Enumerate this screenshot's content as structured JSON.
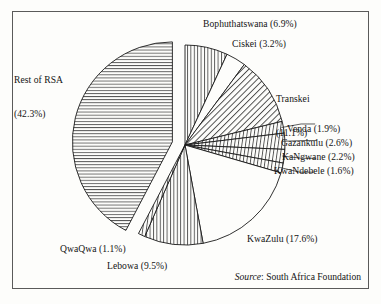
{
  "figure": {
    "background_color": "#fdfdfb",
    "frame_color": "#5a5a5a",
    "slice_line_color": "#1a1a1a"
  },
  "source": {
    "prefix": "Source",
    "separator": ": ",
    "text": "South Africa Foundation"
  },
  "chart_data": {
    "type": "pie",
    "title": "",
    "subtitle": "",
    "xlabel": "",
    "ylabel": "",
    "legend_position": "none",
    "grid": false,
    "units": "percent",
    "total": 100.0,
    "start_angle_deg": 0,
    "direction": "clockwise",
    "center": {
      "x": 185,
      "y": 145
    },
    "radius": 100,
    "categories": [
      "Bophuthatswana",
      "Ciskei",
      "Transkei",
      "Venda",
      "Gazankulu",
      "KaNgwane",
      "KwaNdebele",
      "KwaZulu",
      "Lebowa",
      "QwaQwa",
      "Rest of RSA"
    ],
    "values": [
      6.9,
      3.2,
      11.1,
      1.9,
      2.6,
      2.2,
      1.6,
      17.6,
      9.5,
      1.1,
      42.3
    ],
    "slices": [
      {
        "name": "Bophuthatswana",
        "value": 6.9,
        "label": "Bophuthatswana (6.9%)",
        "label_lines": [
          "Bophuthatswana (6.9%)"
        ],
        "fill": "vertical-hatch",
        "exploded": false,
        "leader": false
      },
      {
        "name": "Ciskei",
        "value": 3.2,
        "label": "Ciskei (3.2%)",
        "label_lines": [
          "Ciskei (3.2%)"
        ],
        "fill": "none",
        "exploded": false,
        "leader": false
      },
      {
        "name": "Transkei",
        "value": 11.1,
        "label": "Transkei (11.1%)",
        "label_lines": [
          "Transkei",
          "(11.1%)"
        ],
        "fill": "diagonal-hatch",
        "exploded": false,
        "leader": false
      },
      {
        "name": "Venda",
        "value": 1.9,
        "label": "Venda (1.9%)",
        "label_lines": [
          "Venda (1.9%)"
        ],
        "fill": "thin-wedge",
        "exploded": false,
        "leader": true
      },
      {
        "name": "Gazankulu",
        "value": 2.6,
        "label": "Gazankulu (2.6%)",
        "label_lines": [
          "Gazankulu (2.6%)"
        ],
        "fill": "thin-wedge",
        "exploded": false,
        "leader": true
      },
      {
        "name": "KaNgwane",
        "value": 2.2,
        "label": "KaNgwane (2.2%)",
        "label_lines": [
          "KaNgwane (2.2%)"
        ],
        "fill": "thin-wedge",
        "exploded": false,
        "leader": true
      },
      {
        "name": "KwaNdebele",
        "value": 1.6,
        "label": "KwaNdebele (1.6%)",
        "label_lines": [
          "KwaNdebele (1.6%)"
        ],
        "fill": "thin-wedge",
        "exploded": false,
        "leader": true
      },
      {
        "name": "KwaZulu",
        "value": 17.6,
        "label": "KwaZulu (17.6%)",
        "label_lines": [
          "KwaZulu (17.6%)"
        ],
        "fill": "none",
        "exploded": false,
        "leader": false
      },
      {
        "name": "Lebowa",
        "value": 9.5,
        "label": "Lebowa (9.5%)",
        "label_lines": [
          "Lebowa (9.5%)"
        ],
        "fill": "vertical-hatch",
        "exploded": false,
        "leader": false
      },
      {
        "name": "QwaQwa",
        "value": 1.1,
        "label": "QwaQwa (1.1%)",
        "label_lines": [
          "QwaQwa (1.1%)"
        ],
        "fill": "thin-wedge",
        "exploded": false,
        "leader": false
      },
      {
        "name": "Rest of RSA",
        "value": 42.3,
        "label": "Rest of RSA (42.3%)",
        "label_lines": [
          "Rest of RSA",
          "(42.3%)"
        ],
        "fill": "horizontal-hatch",
        "exploded": true,
        "leader": false
      }
    ]
  }
}
